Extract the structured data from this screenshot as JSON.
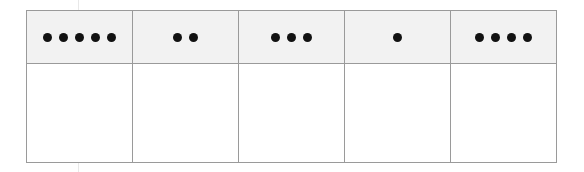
{
  "worksheet": {
    "kind": "dot-count-table",
    "columns": 5,
    "rows": 2,
    "colors": {
      "header_fill": "#f2f2f2",
      "body_fill": "#ffffff",
      "border": "#9a9a9a",
      "dot": "#121212",
      "page_background": "#ffffff"
    },
    "header_row": {
      "name": "dot-groups-row",
      "cells": [
        {
          "id": "cell-1",
          "dot_count": 5,
          "dots_label": "5 dots"
        },
        {
          "id": "cell-2",
          "dot_count": 2,
          "dots_label": "2 dots"
        },
        {
          "id": "cell-3",
          "dot_count": 3,
          "dots_label": "3 dots"
        },
        {
          "id": "cell-4",
          "dot_count": 1,
          "dots_label": "1 dot"
        },
        {
          "id": "cell-5",
          "dot_count": 4,
          "dots_label": "4 dots"
        }
      ]
    },
    "answer_row": {
      "name": "answer-row",
      "cells": [
        {
          "id": "answer-1",
          "value": ""
        },
        {
          "id": "answer-2",
          "value": ""
        },
        {
          "id": "answer-3",
          "value": ""
        },
        {
          "id": "answer-4",
          "value": ""
        },
        {
          "id": "answer-5",
          "value": ""
        }
      ]
    }
  },
  "chart_data": {
    "type": "table",
    "title": "",
    "categories": [
      "Column 1",
      "Column 2",
      "Column 3",
      "Column 4",
      "Column 5"
    ],
    "values": [
      5,
      2,
      3,
      1,
      4
    ],
    "series": [
      {
        "name": "dot count",
        "values": [
          5,
          2,
          3,
          1,
          4
        ]
      },
      {
        "name": "answer",
        "values": [
          "",
          "",
          "",
          "",
          ""
        ]
      }
    ],
    "xlabel": "",
    "ylabel": "",
    "grid": true,
    "legend": "none"
  }
}
